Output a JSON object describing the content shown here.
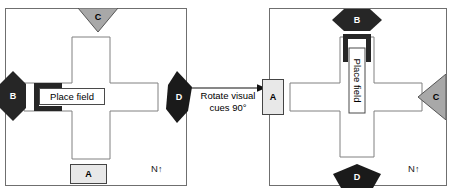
{
  "figure": {
    "type": "diagram"
  },
  "transition": {
    "arrow": "arrow-right-icon",
    "caption_line1": "Rotate visual",
    "caption_line2": "cues 90°"
  },
  "panels": [
    {
      "id": "before",
      "compass": "N",
      "compass_arrow": "↑",
      "place_field_label": "Place field",
      "cues": [
        {
          "label": "A",
          "shape": "rectangle",
          "fill": "#e8e8e8",
          "position": "bottom"
        },
        {
          "label": "B",
          "shape": "hexagon-vertical",
          "fill": "#262626",
          "position": "left"
        },
        {
          "label": "C",
          "shape": "triangle-down",
          "fill": "#a8a8a8",
          "position": "top"
        },
        {
          "label": "D",
          "shape": "hexagon-vertical",
          "fill": "#1a1a1a",
          "position": "right"
        }
      ]
    },
    {
      "id": "after",
      "compass": "N",
      "compass_arrow": "↑",
      "place_field_label": "Place field",
      "cues": [
        {
          "label": "A",
          "shape": "rectangle",
          "fill": "#e8e8e8",
          "position": "left"
        },
        {
          "label": "B",
          "shape": "hexagon-horizontal",
          "fill": "#262626",
          "position": "top"
        },
        {
          "label": "C",
          "shape": "triangle-left",
          "fill": "#a8a8a8",
          "position": "right"
        },
        {
          "label": "D",
          "shape": "pentagon",
          "fill": "#1a1a1a",
          "position": "bottom"
        }
      ]
    }
  ]
}
